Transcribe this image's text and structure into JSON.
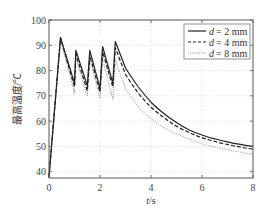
{
  "chart_data": {
    "type": "line",
    "title": "",
    "xlabel": "t/s",
    "ylabel": "最高温度/℃",
    "xlim": [
      0,
      8
    ],
    "ylim": [
      37.5,
      100
    ],
    "xticks": [
      0,
      2,
      4,
      6,
      8
    ],
    "yticks": [
      40,
      50,
      60,
      70,
      80,
      90,
      100
    ],
    "grid": true,
    "legend_position": "upper right",
    "series": [
      {
        "name": "d = 2 mm",
        "style": "solid",
        "color": "#222222",
        "x": [
          0,
          0.45,
          1.0,
          1.05,
          1.5,
          1.6,
          2.0,
          2.1,
          2.5,
          2.6,
          3.0,
          3.5,
          4.0,
          4.5,
          5.0,
          5.5,
          6.0,
          6.5,
          7.0,
          7.5,
          8.0
        ],
        "y": [
          38,
          93,
          75,
          88,
          74,
          88,
          73,
          89.5,
          75,
          91.5,
          81,
          73.5,
          67.5,
          63,
          59.5,
          56.5,
          54.5,
          53,
          51.8,
          50.8,
          50
        ]
      },
      {
        "name": "d = 4 mm",
        "style": "dashed",
        "color": "#222222",
        "x": [
          0,
          0.45,
          1.0,
          1.05,
          1.5,
          1.6,
          2.0,
          2.1,
          2.5,
          2.6,
          3.0,
          3.5,
          4.0,
          4.5,
          5.0,
          5.5,
          6.0,
          6.5,
          7.0,
          7.5,
          8.0
        ],
        "y": [
          38,
          93,
          73.5,
          86.5,
          72,
          86,
          71.5,
          87.5,
          73.5,
          89,
          78.5,
          71,
          65.5,
          61.5,
          58,
          55.5,
          53.5,
          52,
          50.8,
          49.8,
          49
        ]
      },
      {
        "name": "d = 8 mm",
        "style": "dotted",
        "color": "#888888",
        "x": [
          0,
          0.45,
          1.0,
          1.05,
          1.5,
          1.6,
          2.0,
          2.1,
          2.5,
          2.6,
          3.0,
          3.5,
          4.0,
          4.5,
          5.0,
          5.5,
          6.0,
          6.5,
          7.0,
          7.5,
          8.0
        ],
        "y": [
          38,
          92.5,
          71,
          85,
          70,
          84.5,
          69,
          85,
          68.5,
          84,
          73,
          65.5,
          61,
          57.5,
          55,
          53,
          51,
          49.8,
          48.8,
          47.8,
          47
        ]
      }
    ]
  },
  "legend": {
    "items": [
      {
        "label": "d = 2 mm",
        "var": "d",
        "value": "= 2 mm"
      },
      {
        "label": "d = 4 mm",
        "var": "d",
        "value": "= 4 mm"
      },
      {
        "label": "d = 8 mm",
        "var": "d",
        "value": "= 8 mm"
      }
    ]
  },
  "axes": {
    "xlabel_var": "t",
    "xlabel_unit": "/s",
    "ylabel": "最高温度/℃",
    "xtick_labels": [
      "0",
      "2",
      "4",
      "6",
      "8"
    ],
    "ytick_labels": [
      "40",
      "50",
      "60",
      "70",
      "80",
      "90",
      "100"
    ]
  },
  "colors": {
    "frame": "#555555",
    "grid": "#cfcfcf",
    "solid_line": "#222222",
    "dashed_line": "#222222",
    "dotted_line": "#888888"
  }
}
